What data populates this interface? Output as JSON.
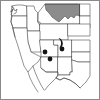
{
  "figure": {
    "kind": "species-distribution-map",
    "region_label": "Western United States",
    "frame_color": "#8a8a8a",
    "background_color": "#ffffff",
    "outline_color": "#3a3a3a",
    "shaded_region_color": "#8c8c8c",
    "marker_color": "#141414",
    "width": 100,
    "height": 100
  },
  "map_data": {
    "type": "point-distribution",
    "projection_extent": {
      "x_min": 0,
      "x_max": 100,
      "y_min": 0,
      "y_max": 100
    },
    "shaded_regions": [
      {
        "name": "northern-shaded-area",
        "label": "Montana",
        "fill": "#8c8c8c",
        "centroid_x": 60,
        "centroid_y": 12
      }
    ],
    "filled_range_polygons": [
      {
        "name": "crescent-range-polygon",
        "label": "Crescent range polygon",
        "fill": "#141414",
        "centroid_x": 60,
        "centroid_y": 42,
        "width": 5,
        "height": 10
      }
    ],
    "occurrence_points": [
      {
        "name": "occurrence-point-1",
        "x": 45,
        "y": 52,
        "radius": 2.4
      },
      {
        "name": "occurrence-point-2",
        "x": 50,
        "y": 59,
        "radius": 2.4
      },
      {
        "name": "occurrence-point-3",
        "x": 62,
        "y": 49,
        "radius": 2.4
      }
    ],
    "state_boundaries_visible": true,
    "coastline_visible": true,
    "graticule_visible": false,
    "legend_visible": false,
    "title_visible": false,
    "axis_labels_visible": false
  }
}
